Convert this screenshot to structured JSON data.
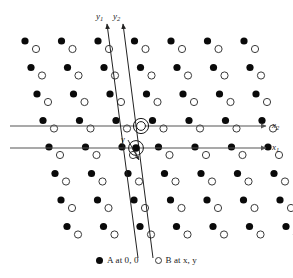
{
  "figure": {
    "width": 293,
    "height": 278,
    "background": "#ffffff"
  },
  "chart_data": {
    "type": "scatter",
    "title": "",
    "xlabel": "",
    "ylabel": "",
    "grid": false,
    "legend_position": "bottom-center",
    "series": [
      {
        "name": "A at 0, 0",
        "marker": "filled-circle",
        "color": "#0a0a0a",
        "radius_px": 3.6,
        "description": "A atoms occupy lattice sites at fractional coordinates 0, 0"
      },
      {
        "name": "B at x, y",
        "marker": "open-circle",
        "color": "#ffffff",
        "stroke": "#3a3a3a",
        "radius_px": 3.6,
        "description": "B atoms occupy general positions at fractional coordinates x, y"
      }
    ],
    "lattice": {
      "rows": 8,
      "cols": 7,
      "col_spacing_px": 36.5,
      "row_spacing_px": 26.5,
      "row_shift_px": 6.0,
      "b_offset_x_px": 11.0,
      "b_offset_y_px": 8.0,
      "origin_col_index": 3,
      "origin_row_index": 4,
      "first_a_x_px": 25.0,
      "first_a_y_px": 41.0
    },
    "axes": [
      {
        "name": "x1",
        "label": "x",
        "subscript": "1",
        "orientation": "horizontal",
        "y_px": 148,
        "x_start_px": 10,
        "x_end_px": 266,
        "arrow": "end",
        "passes_through": "A at 0, 0"
      },
      {
        "name": "x2",
        "label": "x",
        "subscript": "2",
        "orientation": "horizontal",
        "y_px": 126,
        "x_start_px": 10,
        "x_end_px": 266,
        "arrow": "end",
        "passes_through": "B at x, y"
      },
      {
        "name": "y1",
        "label": "y",
        "subscript": "1",
        "orientation": "near-vertical",
        "x_top_px": 107,
        "y_top_px": 24,
        "x_bottom_px": 138,
        "y_bottom_px": 258,
        "arrow": "top",
        "passes_through": "A at 0, 0"
      },
      {
        "name": "y2",
        "label": "y",
        "subscript": "2",
        "orientation": "near-vertical",
        "x_top_px": 123,
        "y_top_px": 24,
        "x_bottom_px": 153,
        "y_bottom_px": 258,
        "arrow": "top",
        "passes_through": "B at x, y"
      }
    ],
    "annotations": [
      {
        "name": "y-offset",
        "label": "y",
        "x_px": 121,
        "y_px": 135,
        "description": "Interaxial offset y between the A origin and the B origin"
      },
      {
        "name": "origin-A",
        "x_px": 136,
        "y_px": 148,
        "marker": "filled-circle-with-ring",
        "description": "A origin highlighted on the x1 axis"
      },
      {
        "name": "origin-B",
        "x_px": 141,
        "y_px": 126,
        "marker": "double-ring-circle",
        "description": "B origin highlighted on the x2 axis"
      }
    ]
  },
  "labels": {
    "x1": {
      "base": "x",
      "sub": "1"
    },
    "x2": {
      "base": "x",
      "sub": "2"
    },
    "y1": {
      "base": "y",
      "sub": "1"
    },
    "y2": {
      "base": "y",
      "sub": "2"
    },
    "y_offset": "y"
  },
  "legend": {
    "items": [
      {
        "marker": "filled-circle",
        "text": "A at 0, 0"
      },
      {
        "marker": "open-circle",
        "text": "B at x, y"
      }
    ]
  },
  "colors": {
    "atom_a": "#0a0a0a",
    "atom_b_stroke": "#3a3a3a",
    "axis": "#555555",
    "text": "#1a1a1a",
    "background": "#ffffff"
  }
}
